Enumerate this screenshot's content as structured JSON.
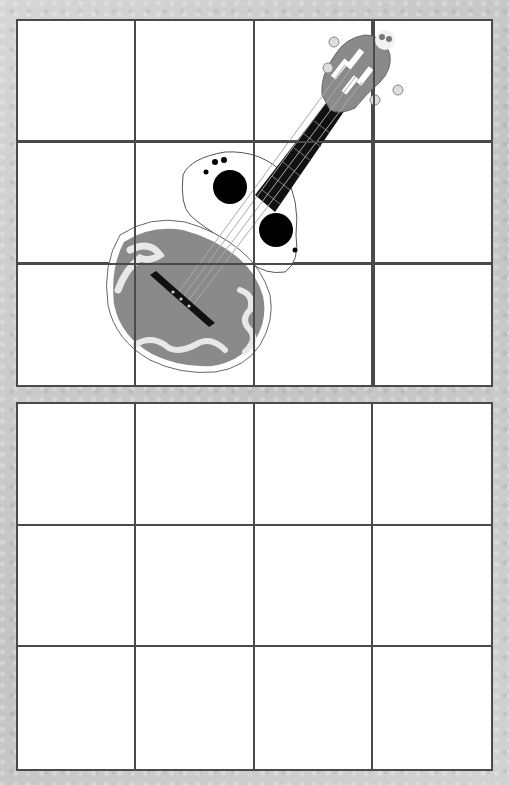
{
  "worksheet": {
    "type": "grid-drawing-activity",
    "top_grid": {
      "rows": 3,
      "columns": 4,
      "content": "ukulele-illustration"
    },
    "bottom_grid": {
      "rows": 3,
      "columns": 4,
      "content": "empty"
    }
  },
  "colors": {
    "background": "#cfcfcf",
    "grid_line": "#4a4a4a",
    "body_gray": "#8a8a8a",
    "neck_black": "#111111"
  }
}
